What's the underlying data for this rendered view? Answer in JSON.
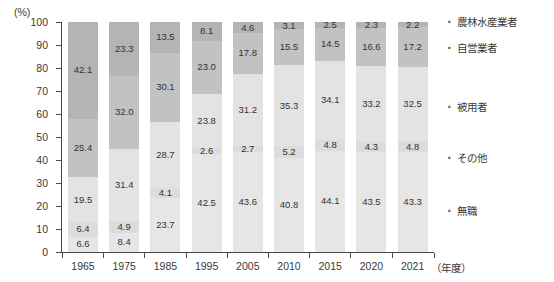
{
  "chart_data": {
    "type": "bar",
    "stacked": true,
    "orientation": "vertical",
    "title": "",
    "xlabel": "年度",
    "ylabel": "",
    "unit_label": "(%)",
    "x_unit_suffix": "（年度）",
    "ylim": [
      0,
      100
    ],
    "y_ticks": [
      0,
      10,
      20,
      30,
      40,
      50,
      60,
      70,
      80,
      90,
      100
    ],
    "grid": false,
    "legend_position": "right",
    "categories": [
      "1965",
      "1975",
      "1985",
      "1995",
      "2005",
      "2010",
      "2015",
      "2020",
      "2021"
    ],
    "series": [
      {
        "name": "農林水産業者",
        "color": "#b4b4b4",
        "values": [
          42.1,
          23.3,
          13.5,
          8.1,
          4.6,
          3.1,
          2.5,
          2.3,
          2.2
        ]
      },
      {
        "name": "自営業者",
        "color": "#c2c2c2",
        "values": [
          25.4,
          32.0,
          30.1,
          23.0,
          17.8,
          15.5,
          14.5,
          16.6,
          17.2
        ]
      },
      {
        "name": "被用者",
        "color": "#e3e3e3",
        "values": [
          19.5,
          31.4,
          28.7,
          23.8,
          31.2,
          35.3,
          34.1,
          33.2,
          32.5
        ]
      },
      {
        "name": "その他",
        "color": "#dcdcdc",
        "values": [
          6.4,
          4.9,
          4.1,
          2.6,
          2.7,
          5.2,
          4.8,
          4.3,
          4.8
        ]
      },
      {
        "name": "無職",
        "color": "#e6e6e6",
        "values": [
          6.6,
          8.4,
          23.7,
          42.5,
          43.6,
          40.8,
          44.1,
          43.5,
          43.3
        ]
      }
    ],
    "legend_label_y_px": [
      22,
      48,
      107,
      158,
      211
    ]
  }
}
